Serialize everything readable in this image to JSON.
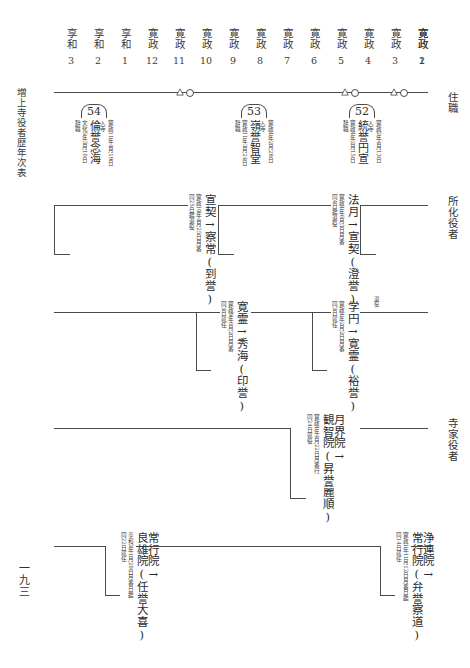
{
  "document": {
    "left_title": "増上寺役者歴年次表",
    "page_number": "一九三"
  },
  "side_labels": {
    "abbots": "住職",
    "trainee_officers": "所化役者",
    "temple_family_officers": "寺家役者"
  },
  "year_header": {
    "columns": [
      {
        "era": "享和",
        "year": "3"
      },
      {
        "era": "享和",
        "year": "2"
      },
      {
        "era": "享和",
        "year": "1"
      },
      {
        "era": "寛政",
        "year": "12"
      },
      {
        "era": "寛政",
        "year": "11"
      },
      {
        "era": "寛政",
        "year": "10"
      },
      {
        "era": "寛政",
        "year": "9"
      },
      {
        "era": "寛政",
        "year": "8"
      },
      {
        "era": "寛政",
        "year": "7"
      },
      {
        "era": "寛政",
        "year": "6"
      },
      {
        "era": "寛政",
        "year": "5"
      },
      {
        "era": "寛政",
        "year": "4"
      },
      {
        "era": "寛政",
        "year": "3"
      },
      {
        "era": "寛政",
        "year": "2"
      },
      {
        "era": "寛政",
        "year": "1"
      }
    ]
  },
  "abbots": {
    "entries": [
      {
        "number": "54",
        "name": "倫誉念海",
        "entry_label": "入寺",
        "entry_date": "寛政11年4月19日",
        "exit_label": "辞職",
        "exit_date": "文化5年3月10日"
      },
      {
        "number": "53",
        "name": "嶺誉智堂",
        "entry_label": "入寺",
        "entry_date": "寛政4年2月28日",
        "exit_label": "辞職",
        "exit_date": "寛政11年3月24日"
      },
      {
        "number": "52",
        "name": "統誉円宣",
        "entry_label": "入寺",
        "entry_date": "寛政2年4月13日",
        "exit_label": "辞職",
        "exit_date": "寛政4年2月15日"
      }
    ]
  },
  "trainee_officers": {
    "row1": [
      {
        "name": "宣契→察常(到誉)",
        "note_date": "寛政10年4月25日月番",
        "note_action": "同25日鑑退役"
      },
      {
        "name": "法月→宣契(澄誉)",
        "note_date": "寛政4年6月3日月番",
        "note_action": "同4日鑑退役"
      }
    ],
    "row2": [
      {
        "name": "寛霊→秀海(印誉)",
        "note_date": "寛政9年6月2日月番",
        "note_action": "同3日就任"
      },
      {
        "name": "学円→寛霊(裕誉)",
        "note_date": "寛政4年2月2日月番",
        "note_action": "同3日就任",
        "tag": "退役"
      }
    ]
  },
  "temple_family_officers": {
    "row1": [
      {
        "name": "観智院(昇誉麗順)",
        "predecessor": "月界院→",
        "note_date": "寛政4年4月22日月番行",
        "note_action": "同24日就役"
      }
    ],
    "row2": [
      {
        "name": "良雄院(任誉大喜)",
        "predecessor": "常行院→",
        "note_date": "享和3年1月20日月番日鑑",
        "note_action": "同22日就任"
      },
      {
        "name": "常行院(弁誉察道)",
        "predecessor": "浄連院→",
        "note_date": "寛政1年11月12日月番日鑑",
        "note_action": "同14日就任"
      }
    ]
  },
  "markers": {
    "symbol_triangle": "triangle-marker",
    "symbol_circle": "circle-marker"
  },
  "colors": {
    "ink": "#2b2b2b",
    "rule": "#4a4a4a",
    "paper": "#ffffff"
  }
}
